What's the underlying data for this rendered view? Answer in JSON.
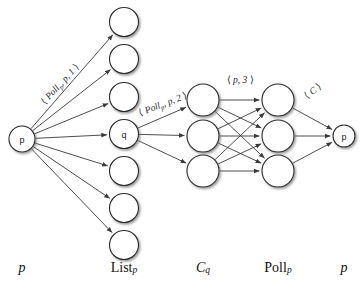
{
  "figure": {
    "background_color": "#ffffff",
    "stroke_color": "#2b2b2b",
    "node_fill": "#ffffff"
  },
  "columns": [
    {
      "id": "col-p-left",
      "label_plain": "p",
      "label_main": "p",
      "label_sub": "",
      "x": 22,
      "italic": true
    },
    {
      "id": "col-list-p",
      "label_plain": "Listp",
      "label_main": "List",
      "label_sub": "p",
      "x": 124,
      "italic": false
    },
    {
      "id": "col-cq",
      "label_plain": "Cq",
      "label_main": "C",
      "label_sub": "q",
      "x": 203,
      "italic": true
    },
    {
      "id": "col-poll-p",
      "label_plain": "Pollp",
      "label_main": "Poll",
      "label_sub": "p",
      "x": 278,
      "italic": false
    },
    {
      "id": "col-p-right",
      "label_plain": "p",
      "label_main": "p",
      "label_sub": "",
      "x": 344,
      "italic": true
    }
  ],
  "nodes": [
    {
      "id": "p-left",
      "name": "node-p-source",
      "cx": 22,
      "cy": 139,
      "r": 13,
      "label": "p"
    },
    {
      "id": "l1",
      "name": "node-list-1",
      "cx": 124,
      "cy": 22,
      "r": 14.5,
      "label": ""
    },
    {
      "id": "l2",
      "name": "node-list-2",
      "cx": 124,
      "cy": 59,
      "r": 14.5,
      "label": ""
    },
    {
      "id": "l3",
      "name": "node-list-3",
      "cx": 124,
      "cy": 97,
      "r": 14.5,
      "label": ""
    },
    {
      "id": "l4",
      "name": "node-list-q",
      "cx": 124,
      "cy": 134,
      "r": 14.5,
      "label": "q"
    },
    {
      "id": "l5",
      "name": "node-list-5",
      "cx": 124,
      "cy": 171,
      "r": 14.5,
      "label": ""
    },
    {
      "id": "l6",
      "name": "node-list-6",
      "cx": 124,
      "cy": 208,
      "r": 14.5,
      "label": ""
    },
    {
      "id": "l7",
      "name": "node-list-7",
      "cx": 124,
      "cy": 245,
      "r": 14.5,
      "label": ""
    },
    {
      "id": "c1",
      "name": "node-cq-1",
      "cx": 203,
      "cy": 100,
      "r": 16,
      "label": ""
    },
    {
      "id": "c2",
      "name": "node-cq-2",
      "cx": 203,
      "cy": 136,
      "r": 16,
      "label": ""
    },
    {
      "id": "c3",
      "name": "node-cq-3",
      "cx": 203,
      "cy": 171,
      "r": 16,
      "label": ""
    },
    {
      "id": "k1",
      "name": "node-pollp-1",
      "cx": 278,
      "cy": 100,
      "r": 16,
      "label": ""
    },
    {
      "id": "k2",
      "name": "node-pollp-2",
      "cx": 278,
      "cy": 136,
      "r": 16,
      "label": ""
    },
    {
      "id": "k3",
      "name": "node-pollp-3",
      "cx": 278,
      "cy": 171,
      "r": 16,
      "label": ""
    },
    {
      "id": "p-right",
      "name": "node-p-sink",
      "cx": 344,
      "cy": 136,
      "r": 11,
      "label": "p"
    }
  ],
  "edges": [
    {
      "from": "p-left",
      "to": "l1",
      "name": "edge-p-to-list-1"
    },
    {
      "from": "p-left",
      "to": "l2",
      "name": "edge-p-to-list-2"
    },
    {
      "from": "p-left",
      "to": "l3",
      "name": "edge-p-to-list-3"
    },
    {
      "from": "p-left",
      "to": "l4",
      "name": "edge-p-to-list-q"
    },
    {
      "from": "p-left",
      "to": "l5",
      "name": "edge-p-to-list-5"
    },
    {
      "from": "p-left",
      "to": "l6",
      "name": "edge-p-to-list-6"
    },
    {
      "from": "p-left",
      "to": "l7",
      "name": "edge-p-to-list-7"
    },
    {
      "from": "l4",
      "to": "c1",
      "name": "edge-q-to-cq-1"
    },
    {
      "from": "l4",
      "to": "c2",
      "name": "edge-q-to-cq-2"
    },
    {
      "from": "l4",
      "to": "c3",
      "name": "edge-q-to-cq-3"
    },
    {
      "from": "c1",
      "to": "k1",
      "name": "edge-cq1-to-pollp1"
    },
    {
      "from": "c1",
      "to": "k2",
      "name": "edge-cq1-to-pollp2"
    },
    {
      "from": "c1",
      "to": "k3",
      "name": "edge-cq1-to-pollp3"
    },
    {
      "from": "c2",
      "to": "k1",
      "name": "edge-cq2-to-pollp1"
    },
    {
      "from": "c2",
      "to": "k2",
      "name": "edge-cq2-to-pollp2"
    },
    {
      "from": "c2",
      "to": "k3",
      "name": "edge-cq2-to-pollp3"
    },
    {
      "from": "c3",
      "to": "k1",
      "name": "edge-cq3-to-pollp1"
    },
    {
      "from": "c3",
      "to": "k2",
      "name": "edge-cq3-to-pollp2"
    },
    {
      "from": "c3",
      "to": "k3",
      "name": "edge-cq3-to-pollp3"
    },
    {
      "from": "k1",
      "to": "p-right",
      "name": "edge-pollp1-to-p"
    },
    {
      "from": "k2",
      "to": "p-right",
      "name": "edge-pollp2-to-p"
    },
    {
      "from": "k3",
      "to": "p-right",
      "name": "edge-pollp3-to-p"
    }
  ],
  "edge_labels": [
    {
      "id": "lbl-poll-p-1",
      "name": "edge-label-poll-p-1",
      "text": "< Pollp, p, 1 >",
      "parts": {
        "open": "⟨",
        "base": "Poll",
        "sub": "p",
        "rest": ", p, 1",
        "close": "⟩"
      },
      "x": 60,
      "y": 84,
      "rotate": -47
    },
    {
      "id": "lbl-poll-p-2",
      "name": "edge-label-poll-p-2",
      "text": "< Pollp, p, 2 >",
      "parts": {
        "open": "⟨",
        "base": "Poll",
        "sub": "p",
        "rest": ", p, 2",
        "close": "⟩"
      },
      "x": 163,
      "y": 104,
      "rotate": -21
    },
    {
      "id": "lbl-p-3",
      "name": "edge-label-p-3",
      "text": "< p, 3 >",
      "parts": {
        "open": "⟨",
        "base": "p",
        "sub": "",
        "rest": ", 3",
        "close": "⟩"
      },
      "x": 240,
      "y": 80,
      "rotate": 0
    },
    {
      "id": "lbl-c",
      "name": "edge-label-c",
      "text": "< C >",
      "parts": {
        "open": "⟨",
        "base": "C",
        "sub": "",
        "rest": "",
        "close": "⟩"
      },
      "x": 313,
      "y": 91,
      "rotate": -37
    }
  ]
}
